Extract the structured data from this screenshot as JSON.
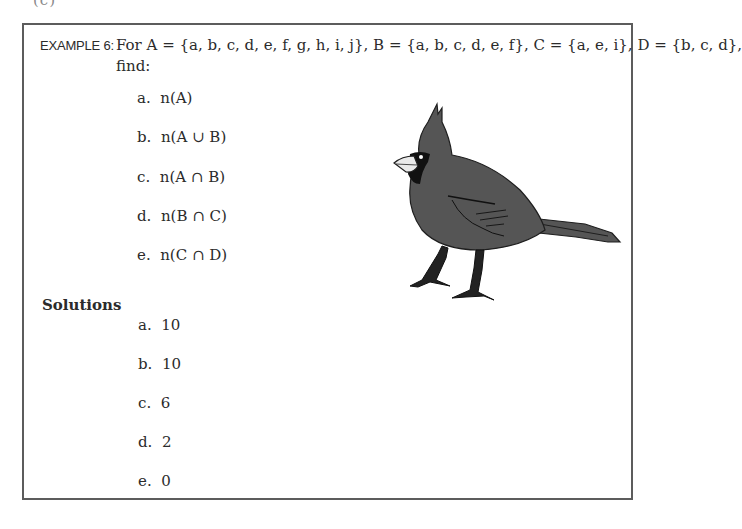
{
  "page_fragment": "(c)",
  "example": {
    "label": "EXAMPLE 6:",
    "statement": "For A = {a, b, c, d, e, f, g, h, i, j}, B = {a, b, c, d, e, f}, C = {a, e, i}, D = {b, c, d},",
    "statement_cont": "find:",
    "questions": [
      {
        "letter": "a.",
        "expr": "n(A)"
      },
      {
        "letter": "b.",
        "expr": "n(A ∪ B)"
      },
      {
        "letter": "c.",
        "expr": "n(A ∩ B)"
      },
      {
        "letter": "d.",
        "expr": "n(B ∩ C)"
      },
      {
        "letter": "e.",
        "expr": "n(C ∩ D)"
      }
    ]
  },
  "solutions": {
    "heading": "Solutions",
    "answers": [
      {
        "letter": "a.",
        "value": "10"
      },
      {
        "letter": "b.",
        "value": "10"
      },
      {
        "letter": "c.",
        "value": "6"
      },
      {
        "letter": "d.",
        "value": "2"
      },
      {
        "letter": "e.",
        "value": "0"
      }
    ]
  },
  "illustration": {
    "subject": "cardinal-bird",
    "fill": "#555555",
    "outline": "#1e1e1e"
  }
}
